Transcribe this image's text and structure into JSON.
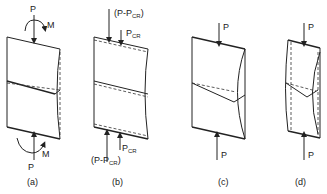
{
  "figure": {
    "panels": [
      {
        "id": "a",
        "caption": "(a)",
        "top_load": "P",
        "top_moment": "M",
        "bottom_load": "P",
        "bottom_moment": "M"
      },
      {
        "id": "b",
        "caption": "(b)",
        "top_load_left": "(P-P",
        "top_load_left_sub": "CR",
        "top_load_left_close": ")",
        "top_load_right": "P",
        "top_load_right_sub": "CR",
        "bottom_load_left": "(P-P",
        "bottom_load_left_sub": "CR",
        "bottom_load_left_close": ")",
        "bottom_load_right": "P",
        "bottom_load_right_sub": "CR"
      },
      {
        "id": "c",
        "caption": "(c)",
        "top_load": "P",
        "bottom_load": "P"
      },
      {
        "id": "d",
        "caption": "(d)",
        "top_load": "P",
        "bottom_load": "P"
      }
    ]
  }
}
